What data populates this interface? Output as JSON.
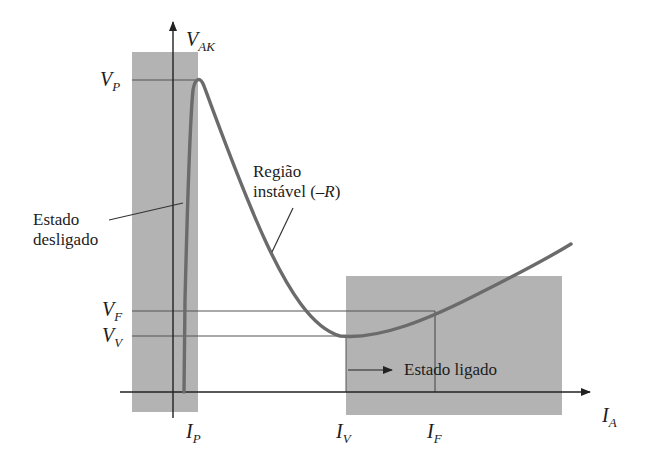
{
  "diagram": {
    "type": "characteristic-curve",
    "colors": {
      "background": "#ffffff",
      "region_fill": "#b3b3b3",
      "curve": "#6b6b6b",
      "axis": "#222222",
      "guide_line": "#555555",
      "text": "#1c1c1c"
    },
    "axes": {
      "y": {
        "symbol": "V",
        "sub": "AK"
      },
      "x": {
        "symbol": "I",
        "sub": "A"
      }
    },
    "y_levels": [
      {
        "id": "vp",
        "symbol": "V",
        "sub": "P"
      },
      {
        "id": "vf",
        "symbol": "V",
        "sub": "F"
      },
      {
        "id": "vv",
        "symbol": "V",
        "sub": "V"
      }
    ],
    "x_levels": [
      {
        "id": "ip",
        "symbol": "I",
        "sub": "P"
      },
      {
        "id": "iv",
        "symbol": "I",
        "sub": "V"
      },
      {
        "id": "if",
        "symbol": "I",
        "sub": "F"
      }
    ],
    "regions": {
      "off": {
        "line1": "Estado",
        "line2": "desligado"
      },
      "unstable": {
        "line1": "Região",
        "line2_prefix": "instável (–",
        "line2_var": "R",
        "line2_suffix": ")"
      },
      "on": {
        "label": "Estado ligado"
      }
    }
  }
}
